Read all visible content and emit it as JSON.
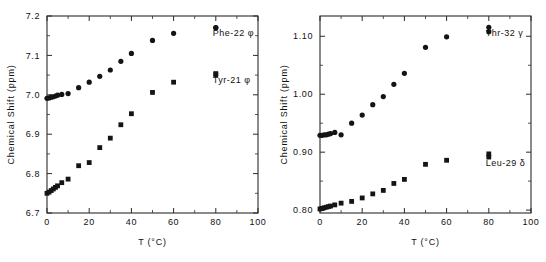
{
  "figure": {
    "panel_count": 2,
    "marker_color": "#141414",
    "axis_color": "#2b2b2b",
    "background": "#ffffff"
  },
  "chart_data": [
    {
      "type": "scatter",
      "panel": "left",
      "title": "",
      "xlabel": "T (°C)",
      "ylabel": "Chemical Shift (ppm)",
      "xlim": [
        0,
        100
      ],
      "ylim": [
        6.7,
        7.2
      ],
      "xticks": [
        0,
        20,
        40,
        60,
        80,
        100
      ],
      "xtick_labels": [
        "0",
        "20",
        "40",
        "60",
        "80",
        "100"
      ],
      "yticks": [
        6.7,
        6.8,
        6.9,
        7.0,
        7.1,
        7.2
      ],
      "ytick_labels": [
        "6.7",
        "6.8",
        "6.9",
        "7.0",
        "7.1",
        "7.2"
      ],
      "x_minor_step": 10,
      "y_minor_step": 0.05,
      "grid": false,
      "legend_position": "inside-right",
      "series": [
        {
          "name": "Phe-22 φ",
          "marker": "circle",
          "legend_x": 0.8,
          "legend_y": 7.148,
          "x": [
            0,
            1,
            2,
            3,
            4,
            5,
            7,
            10,
            15,
            20,
            25,
            30,
            35,
            40,
            50,
            60,
            80
          ],
          "y": [
            6.991,
            6.992,
            6.994,
            6.995,
            6.997,
            6.999,
            7.001,
            7.003,
            7.018,
            7.032,
            7.047,
            7.063,
            7.085,
            7.105,
            7.138,
            7.156,
            7.17
          ]
        },
        {
          "name": "Tyr-21 φ",
          "marker": "square",
          "legend_x": 0.8,
          "legend_y": 7.031,
          "x": [
            0,
            1,
            2,
            3,
            4,
            5,
            7,
            10,
            15,
            20,
            25,
            30,
            35,
            40,
            50,
            60,
            80
          ],
          "y": [
            6.75,
            6.753,
            6.757,
            6.761,
            6.765,
            6.769,
            6.777,
            6.786,
            6.82,
            6.828,
            6.866,
            6.89,
            6.924,
            6.952,
            7.006,
            7.032,
            7.051
          ]
        }
      ]
    },
    {
      "type": "scatter",
      "panel": "right",
      "title": "",
      "xlabel": "T (°C)",
      "ylabel": "Chemical Shift (ppm)",
      "xlim": [
        0,
        100
      ],
      "ylim": [
        0.795,
        1.135
      ],
      "xticks": [
        0,
        20,
        40,
        60,
        80,
        100
      ],
      "xtick_labels": [
        "0",
        "20",
        "40",
        "60",
        "80",
        "100"
      ],
      "yticks": [
        0.8,
        0.9,
        1.0,
        1.1
      ],
      "ytick_labels": [
        "0.80",
        "0.90",
        "1.00",
        "1.10"
      ],
      "x_minor_step": 10,
      "y_minor_step": 0.05,
      "grid": false,
      "legend_position": "inside-right",
      "series": [
        {
          "name": "Thr-32 γ",
          "marker": "circle",
          "legend_x": 0.8,
          "legend_y": 1.1,
          "x": [
            0,
            1,
            2,
            3,
            4,
            5,
            7,
            10,
            15,
            20,
            25,
            30,
            35,
            40,
            50,
            60,
            80
          ],
          "y": [
            0.929,
            0.929,
            0.93,
            0.93,
            0.931,
            0.932,
            0.934,
            0.93,
            0.95,
            0.964,
            0.982,
            0.996,
            1.017,
            1.036,
            1.081,
            1.099,
            1.108
          ]
        },
        {
          "name": "Leu-29 δ",
          "marker": "square",
          "legend_x": 0.8,
          "legend_y": 0.876,
          "x": [
            0,
            1,
            2,
            3,
            4,
            5,
            7,
            10,
            15,
            20,
            25,
            30,
            35,
            40,
            50,
            60,
            80
          ],
          "y": [
            0.802,
            0.803,
            0.804,
            0.805,
            0.806,
            0.807,
            0.809,
            0.812,
            0.815,
            0.821,
            0.828,
            0.834,
            0.846,
            0.853,
            0.879,
            0.886,
            0.897
          ]
        }
      ]
    }
  ]
}
